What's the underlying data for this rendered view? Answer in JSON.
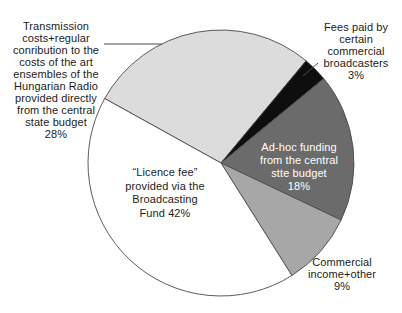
{
  "chart_data": {
    "type": "pie",
    "title": "",
    "unit": "percent",
    "slices": [
      {
        "name": "transmission-costs",
        "value": 28,
        "color": "#dcdcdc",
        "label_color": "#1c1c1c",
        "label_position": "outside-left",
        "lines": [
          "Transmission",
          "costs+regular",
          "conribution to the",
          "costs of the art",
          "ensembles of the",
          "Hungarian Radio",
          "provided directly",
          "from the central",
          "state budget",
          "28%"
        ]
      },
      {
        "name": "commercial-broadcaster-fees",
        "value": 3,
        "color": "#0e0e0e",
        "label_color": "#1c1c1c",
        "label_position": "outside-top-right",
        "lines": [
          "Fees paid by",
          "certain",
          "commercial",
          "broadcasters",
          "3%"
        ]
      },
      {
        "name": "ad-hoc-funding",
        "value": 18,
        "color": "#6b6b6b",
        "label_color": "#ffffff",
        "label_position": "inside",
        "lines": [
          "Ad-hoc funding",
          "from the central",
          "stte budget",
          "18%"
        ]
      },
      {
        "name": "commercial-income",
        "value": 9,
        "color": "#a7a7a7",
        "label_color": "#1c1c1c",
        "label_position": "outside-bottom-right",
        "lines": [
          "Commercial",
          "income+other",
          "9%"
        ]
      },
      {
        "name": "licence-fee",
        "value": 42,
        "color": "#ffffff",
        "label_color": "#1c1c1c",
        "label_position": "inside",
        "lines": [
          "“Licence fee”",
          "provided via the",
          "Broadcasting",
          "Fund 42%"
        ]
      }
    ],
    "geometry": {
      "center_x": 221,
      "center_y": 163,
      "radius": 133,
      "start_angle_deg": 151,
      "direction": "clockwise",
      "stroke_color": "#4a4a4a",
      "stroke_width": 0.9
    },
    "leader_lines": [
      {
        "for": "transmission-costs",
        "x1": 104,
        "y1": 44,
        "x2": 162,
        "y2": 44
      },
      {
        "for": "commercial-broadcaster-fees",
        "x1": 318,
        "y1": 63,
        "x2": 303,
        "y2": 76
      }
    ],
    "legend": "none",
    "background": "#ffffff"
  }
}
